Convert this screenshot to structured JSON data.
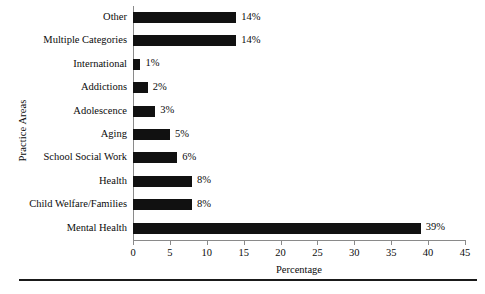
{
  "chart_data": {
    "type": "bar",
    "orientation": "horizontal",
    "title": "",
    "xlabel": "Percentage",
    "ylabel": "Practice Areas",
    "xlim": [
      0,
      45
    ],
    "xticks": [
      0,
      5,
      10,
      15,
      20,
      25,
      30,
      35,
      40,
      45
    ],
    "grid": false,
    "legend": null,
    "bar_color": "#111111",
    "axis_color": "#8a8a8a",
    "categories": [
      "Other",
      "Multiple Categories",
      "International",
      "Addictions",
      "Adolescence",
      "Aging",
      "School Social Work",
      "Health",
      "Child Welfare/Families",
      "Mental Health"
    ],
    "values": [
      14,
      14,
      1,
      2,
      3,
      5,
      6,
      8,
      8,
      39
    ],
    "value_labels": [
      "14%",
      "14%",
      "1%",
      "2%",
      "3%",
      "5%",
      "6%",
      "8%",
      "8%",
      "39%"
    ]
  }
}
